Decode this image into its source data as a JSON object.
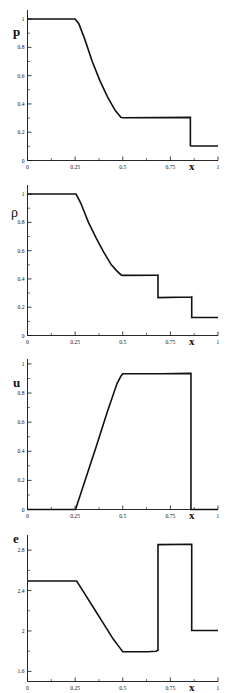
{
  "figure": {
    "line_color": "#111111",
    "background": "#ffffff",
    "xaxis_label": "x"
  },
  "chart_data": [
    {
      "type": "line",
      "title": "",
      "ylabel": "p",
      "xlabel": "x",
      "xlim": [
        0,
        1
      ],
      "ylim": [
        0,
        1.05
      ],
      "xticks": [
        0,
        0.25,
        0.5,
        0.75,
        1
      ],
      "xticklabels": [
        "0",
        "0.25",
        "0.5",
        "0.75",
        "1"
      ],
      "yticks": [
        0,
        0.2,
        0.4,
        0.6,
        0.8,
        1
      ],
      "yticklabels": [
        "0",
        "0.2",
        "0.4",
        "0.6",
        "0.8",
        "1"
      ],
      "grid": false,
      "legend": null,
      "series": [
        {
          "name": "pressure",
          "x": [
            0.0,
            0.25,
            0.27,
            0.3,
            0.34,
            0.38,
            0.42,
            0.46,
            0.49,
            0.5,
            0.68,
            0.855,
            0.855,
            0.86,
            1.0
          ],
          "y": [
            1.0,
            1.0,
            0.965,
            0.86,
            0.7,
            0.565,
            0.45,
            0.355,
            0.305,
            0.302,
            0.303,
            0.305,
            0.105,
            0.103,
            0.103
          ]
        }
      ]
    },
    {
      "type": "line",
      "title": "",
      "ylabel": "ρ",
      "xlabel": "x",
      "xlim": [
        0,
        1
      ],
      "ylim": [
        0,
        1.05
      ],
      "xticks": [
        0,
        0.25,
        0.5,
        0.75,
        1
      ],
      "xticklabels": [
        "0",
        "0.25",
        "0.5",
        "0.75",
        "1"
      ],
      "yticks": [
        0,
        0.2,
        0.4,
        0.6,
        0.8,
        1
      ],
      "yticklabels": [
        "0",
        "0.2",
        "0.4",
        "0.6",
        "0.8",
        "1"
      ],
      "grid": false,
      "legend": null,
      "series": [
        {
          "name": "density",
          "x": [
            0.0,
            0.255,
            0.28,
            0.32,
            0.36,
            0.4,
            0.44,
            0.47,
            0.49,
            0.5,
            0.68,
            0.685,
            0.685,
            0.86,
            0.862,
            0.862,
            1.0
          ],
          "y": [
            1.0,
            1.0,
            0.935,
            0.8,
            0.69,
            0.59,
            0.5,
            0.455,
            0.43,
            0.425,
            0.426,
            0.427,
            0.268,
            0.272,
            0.273,
            0.127,
            0.127
          ]
        }
      ]
    },
    {
      "type": "line",
      "title": "",
      "ylabel": "u",
      "xlabel": "x",
      "xlim": [
        0,
        1
      ],
      "ylim": [
        0,
        1.02
      ],
      "xticks": [
        0,
        0.25,
        0.5,
        0.75,
        1
      ],
      "xticklabels": [
        "0",
        "0.25",
        "0.5",
        "0.75",
        "1"
      ],
      "yticks": [
        0,
        0.2,
        0.4,
        0.6,
        0.8,
        1
      ],
      "yticklabels": [
        "0",
        "0.2",
        "0.4",
        "0.6",
        "0.8",
        "1"
      ],
      "grid": false,
      "legend": null,
      "series": [
        {
          "name": "velocity",
          "x": [
            0.0,
            0.252,
            0.3,
            0.36,
            0.42,
            0.47,
            0.49,
            0.5,
            0.7,
            0.857,
            0.858,
            0.858,
            1.0
          ],
          "y": [
            0.0,
            0.0,
            0.19,
            0.43,
            0.675,
            0.865,
            0.915,
            0.932,
            0.932,
            0.935,
            0.935,
            0.0,
            0.0
          ]
        }
      ]
    },
    {
      "type": "line",
      "title": "",
      "ylabel": "e",
      "xlabel": "x",
      "xlim": [
        0,
        1
      ],
      "ylim": [
        1.5,
        2.95
      ],
      "xticks": [
        0,
        0.25,
        0.5,
        0.75,
        1
      ],
      "xticklabels": [
        "0",
        "0.25",
        "0.5",
        "0.75",
        "1"
      ],
      "yticks": [
        1.6,
        2.0,
        2.4,
        2.8
      ],
      "yticklabels": [
        "1.6",
        "2",
        "2.4",
        "2.8"
      ],
      "grid": false,
      "legend": null,
      "series": [
        {
          "name": "internal-energy",
          "x": [
            0.0,
            0.258,
            0.3,
            0.35,
            0.4,
            0.45,
            0.48,
            0.5,
            0.63,
            0.675,
            0.685,
            0.685,
            0.69,
            0.86,
            0.862,
            0.862,
            1.0
          ],
          "y": [
            2.495,
            2.495,
            2.37,
            2.22,
            2.07,
            1.92,
            1.845,
            1.795,
            1.795,
            1.8,
            1.81,
            2.855,
            2.855,
            2.858,
            2.858,
            2.005,
            2.005
          ]
        }
      ]
    }
  ]
}
